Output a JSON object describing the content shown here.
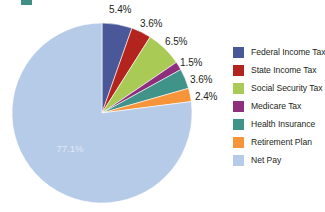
{
  "chart_data": {
    "type": "pie",
    "title": "",
    "categories": [
      "Federal Income Tax",
      "State Income Tax",
      "Social Security Tax",
      "Medicare Tax",
      "Health Insurance",
      "Retirement Plan",
      "Net Pay"
    ],
    "values": [
      5.4,
      3.6,
      6.5,
      1.5,
      3.6,
      2.4,
      77.1
    ],
    "value_labels": [
      "5.4%",
      "3.6%",
      "6.5%",
      "1.5%",
      "3.6%",
      "2.4%",
      "77.1%"
    ],
    "colors": [
      "#4a5899",
      "#b3241f",
      "#a9ca55",
      "#8e2f7d",
      "#3f9389",
      "#f59439",
      "#b6cbe8"
    ],
    "legend_position": "right",
    "start_angle_deg": 0,
    "direction": "clockwise",
    "units": "percent"
  },
  "legend": {
    "items": [
      {
        "label": "Federal Income Tax",
        "color": "#4a5899"
      },
      {
        "label": "State Income Tax",
        "color": "#b3241f"
      },
      {
        "label": "Social Security Tax",
        "color": "#a9ca55"
      },
      {
        "label": "Medicare Tax",
        "color": "#8e2f7d"
      },
      {
        "label": "Health Insurance",
        "color": "#3f9389"
      },
      {
        "label": "Retirement Plan",
        "color": "#f59439"
      },
      {
        "label": "Net Pay",
        "color": "#b6cbe8"
      }
    ]
  },
  "callouts": {
    "federal": "5.4%",
    "state": "3.6%",
    "social_security": "6.5%",
    "medicare": "1.5%",
    "health_insurance": "3.6%",
    "retirement": "2.4%",
    "net_pay": "77.1%"
  }
}
